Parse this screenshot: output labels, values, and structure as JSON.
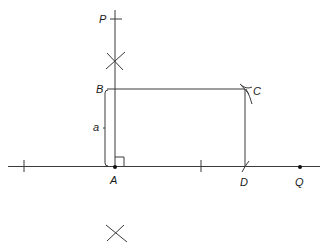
{
  "diagram": {
    "title": "",
    "type": "geometric-construction-rectangle",
    "colors": {
      "ink": "#3a3a3a",
      "label": "#1a1a1a",
      "background": "#ffffff"
    },
    "labels": {
      "P": "P",
      "B": "B",
      "C": "C",
      "a": "a",
      "A": "A",
      "D": "D",
      "Q": "Q"
    },
    "points": [
      {
        "name": "P",
        "x": 115,
        "y": 19
      },
      {
        "name": "B",
        "x": 115,
        "y": 89
      },
      {
        "name": "C",
        "x": 245,
        "y": 89
      },
      {
        "name": "A",
        "x": 115,
        "y": 167
      },
      {
        "name": "D",
        "x": 245,
        "y": 167
      },
      {
        "name": "Q",
        "x": 300,
        "y": 167
      }
    ],
    "segments": [
      {
        "from": "perpendicular-top",
        "to": "A",
        "desc": "perpendicular through A"
      },
      {
        "from": "B",
        "to": "C",
        "desc": "line BC"
      },
      {
        "from": "C",
        "to": "D",
        "desc": "line CD"
      },
      {
        "from": "left-end",
        "to": "right-end",
        "desc": "base line through A, D, Q"
      }
    ],
    "annotations": {
      "side_length": "a",
      "right_angle_at": "A",
      "construction_arcs": [
        "X above A",
        "X below A",
        "arc at C",
        "arc at D"
      ]
    }
  }
}
